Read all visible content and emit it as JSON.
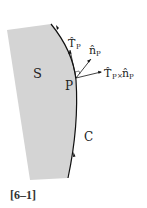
{
  "diagram": {
    "surface_label": "S",
    "curve_label": "C",
    "point_label": "P",
    "tangent_label": "T̂",
    "tangent_sub": "P",
    "normal_label": "n̂",
    "normal_sub": "P",
    "cross_label_T": "T̂",
    "cross_sub1": "P",
    "cross_op": "×",
    "cross_label_n": "n̂",
    "cross_sub2": "P",
    "figure_label": "[6–1]",
    "colors": {
      "surface": "#d4d4d4",
      "curve": "#111111",
      "text": "#222222"
    }
  }
}
